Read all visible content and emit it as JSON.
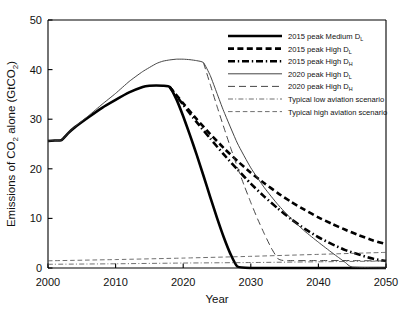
{
  "chart_data": {
    "type": "line",
    "title": "",
    "xlabel": "Year",
    "ylabel": "Emissions of CO2 alone (GtCO2)",
    "ylabel_display": "Emissions of CO₂ alone (GtCO₂)",
    "xlim": [
      2000,
      2050
    ],
    "ylim": [
      0,
      50
    ],
    "xticks": [
      2000,
      2010,
      2020,
      2030,
      2040,
      2050
    ],
    "yticks": [
      0,
      10,
      20,
      30,
      40,
      50
    ],
    "xtick_labels": [
      "2000",
      "2010",
      "2020",
      "2030",
      "2040",
      "2050"
    ],
    "ytick_labels": [
      "0",
      "10",
      "20",
      "30",
      "40",
      "50"
    ],
    "grid": false,
    "legend_position": "top-right",
    "series": [
      {
        "name": "2015 peak Medium D_L",
        "label_main": "2015 peak Medium D",
        "label_sub": "L",
        "style": "thick-solid",
        "stroke_width": 2.6,
        "dasharray": "",
        "color": "#000000",
        "x": [
          2000,
          2001,
          2002,
          2003,
          2004,
          2006,
          2008,
          2010,
          2012,
          2014,
          2015,
          2016,
          2017,
          2018,
          2019,
          2020,
          2021,
          2022,
          2023,
          2024,
          2025,
          2026,
          2027,
          2028,
          2030,
          2035,
          2040,
          2045,
          2050
        ],
        "y": [
          25.6,
          25.7,
          25.8,
          27.2,
          28.4,
          30.4,
          32.3,
          33.9,
          35.4,
          36.5,
          36.75,
          36.8,
          36.75,
          36.5,
          34.0,
          30.6,
          26.8,
          22.8,
          18.6,
          14.3,
          10.1,
          6.2,
          2.8,
          0.3,
          0.0,
          0.0,
          0.0,
          0.0,
          0.0
        ]
      },
      {
        "name": "2015 peak High D_L",
        "label_main": "2015 peak High D",
        "label_sub": "L",
        "style": "thick-dashed",
        "stroke_width": 2.6,
        "dasharray": "6,3.4",
        "color": "#000000",
        "x": [
          2018,
          2020,
          2022,
          2024,
          2026,
          2028,
          2030,
          2032,
          2034,
          2036,
          2038,
          2040,
          2042,
          2044,
          2046,
          2048,
          2050
        ],
        "y": [
          36.5,
          33.2,
          30.0,
          27.0,
          24.2,
          21.6,
          19.2,
          17.1,
          15.1,
          13.3,
          11.7,
          10.2,
          8.9,
          7.7,
          6.6,
          5.6,
          4.8
        ]
      },
      {
        "name": "2015 peak High D_H",
        "label_main": "2015 peak High D",
        "label_sub": "H",
        "style": "thick-dash-dot",
        "stroke_width": 2.6,
        "dasharray": "7,2.8,1.4,2.8",
        "color": "#000000",
        "x": [
          2018,
          2020,
          2022,
          2024,
          2026,
          2028,
          2030,
          2032,
          2034,
          2036,
          2038,
          2040,
          2042,
          2044,
          2046,
          2048,
          2050
        ],
        "y": [
          36.5,
          32.9,
          29.4,
          26.1,
          22.9,
          19.9,
          17.0,
          14.4,
          12.0,
          9.8,
          7.9,
          6.2,
          4.8,
          3.6,
          2.7,
          1.9,
          1.4
        ]
      },
      {
        "name": "2020 peak High D_L",
        "label_main": "2020 peak High D",
        "label_sub": "L",
        "style": "thin-solid",
        "stroke_width": 0.95,
        "dasharray": "",
        "color": "#3b3b3b",
        "x": [
          2000,
          2001,
          2002,
          2003,
          2004,
          2006,
          2008,
          2010,
          2012,
          2014,
          2016,
          2017,
          2018,
          2019,
          2020,
          2021,
          2022,
          2023,
          2024,
          2025,
          2026,
          2028,
          2030,
          2032,
          2034,
          2036,
          2038,
          2040,
          2042,
          2043,
          2044,
          2045,
          2050
        ],
        "y": [
          25.6,
          25.7,
          25.8,
          27.2,
          28.5,
          30.7,
          33.0,
          35.2,
          37.6,
          39.6,
          41.2,
          41.7,
          41.95,
          42.1,
          42.1,
          42.0,
          41.8,
          41.4,
          38.8,
          35.2,
          31.6,
          25.2,
          20.2,
          16.2,
          12.8,
          9.9,
          7.4,
          5.2,
          3.1,
          2.1,
          1.1,
          0.2,
          0.0
        ]
      },
      {
        "name": "2020 peak High D_H",
        "label_main": "2020 peak High D",
        "label_sub": "H",
        "style": "thin-long-dash",
        "stroke_width": 0.95,
        "dasharray": "7,4",
        "color": "#3b3b3b",
        "x": [
          2023,
          2024,
          2025,
          2026,
          2027,
          2028,
          2029,
          2030,
          2031,
          2032,
          2033,
          2034,
          2035,
          2040,
          2045,
          2050
        ],
        "y": [
          41.4,
          37.0,
          32.6,
          28.4,
          24.3,
          20.4,
          16.7,
          13.2,
          9.9,
          6.9,
          4.1,
          1.9,
          1.5,
          1.5,
          1.5,
          1.4
        ]
      },
      {
        "name": "Typical low aviation scenario",
        "label_main": "Typical low aviation scenario",
        "label_sub": "",
        "style": "thin-dash-dot-dot",
        "stroke_width": 0.8,
        "dasharray": "5,2.2,1,2.2",
        "color": "#4a4a4a",
        "x": [
          2000,
          2010,
          2020,
          2030,
          2040,
          2050
        ],
        "y": [
          0.75,
          0.85,
          1.0,
          1.1,
          1.25,
          1.4
        ]
      },
      {
        "name": "Typical high aviation scenario",
        "label_main": "Typical high aviation scenario",
        "label_sub": "",
        "style": "thin-dashed",
        "stroke_width": 0.8,
        "dasharray": "4.6,2.8",
        "color": "#4a4a4a",
        "x": [
          2000,
          2010,
          2020,
          2030,
          2040,
          2050
        ],
        "y": [
          1.45,
          1.7,
          2.0,
          2.35,
          2.75,
          3.15
        ]
      }
    ]
  }
}
